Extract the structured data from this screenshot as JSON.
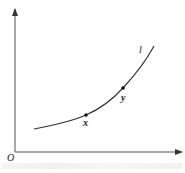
{
  "diagram": {
    "type": "function-curve-sketch",
    "origin_label": "O",
    "curve_label": "l",
    "points": [
      {
        "label": "x",
        "cx": 86,
        "cy": 115
      },
      {
        "label": "y",
        "cx": 123,
        "cy": 88
      }
    ],
    "colors": {
      "axis": "#444444",
      "curve": "#333333",
      "point": "#111111",
      "background": "#ffffff"
    }
  }
}
